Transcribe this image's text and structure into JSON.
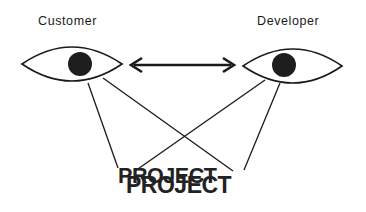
{
  "diagram": {
    "title": "",
    "nodes": {
      "customer": {
        "label": "Customer",
        "icon": "eye-icon"
      },
      "developer": {
        "label": "Developer",
        "icon": "eye-icon"
      },
      "project": {
        "label": "PROJECT",
        "label_duplicate": "PROJECT"
      }
    },
    "edges": [
      {
        "from": "customer",
        "to": "developer",
        "type": "bidirectional-arrow"
      },
      {
        "from": "customer",
        "to": "project",
        "type": "line"
      },
      {
        "from": "customer",
        "to": "project",
        "type": "line"
      },
      {
        "from": "developer",
        "to": "project",
        "type": "line"
      },
      {
        "from": "developer",
        "to": "project",
        "type": "line"
      }
    ],
    "colors": {
      "stroke": "#1a1a1a",
      "pupil": "#1e1e1e",
      "background": "#ffffff"
    }
  }
}
